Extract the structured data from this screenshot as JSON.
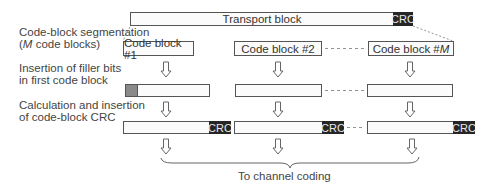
{
  "transport": {
    "label": "Transport block",
    "crc": "CRC"
  },
  "steps": {
    "segmentation": {
      "line1": "Code-block segmentation",
      "line2_prefix": "(",
      "line2_var": "M",
      "line2_suffix": " code blocks)"
    },
    "filler": {
      "line1": "Insertion of filler bits",
      "line2": "in first code block"
    },
    "crc": {
      "line1": "Calculation and insertion",
      "line2": "of code-block CRC"
    }
  },
  "code_blocks": [
    {
      "label": "Code block #1",
      "crc": "CRC"
    },
    {
      "label": "Code block #2",
      "crc": "CRC"
    },
    {
      "label_prefix": "Code block #",
      "label_var": "M",
      "crc": "CRC"
    }
  ],
  "output": {
    "label": "To channel coding"
  },
  "colors": {
    "crc_bg": "#262626",
    "filler": "#8a8a8a",
    "border": "#555555"
  }
}
